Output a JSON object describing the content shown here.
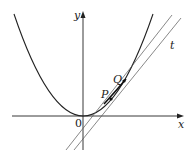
{
  "diagram": {
    "type": "parabola-with-secant-and-tangent",
    "axes": {
      "x_label": "x",
      "y_label": "y",
      "origin_label": "0"
    },
    "curve": {
      "name": "parabola",
      "equation_hint": "y = x^2"
    },
    "points": [
      {
        "label": "P",
        "px": 111,
        "py": 99
      },
      {
        "label": "Q",
        "px": 124,
        "py": 81
      }
    ],
    "lines": [
      {
        "name": "secant-PQ",
        "label": ""
      },
      {
        "name": "tangent",
        "label": "t"
      }
    ],
    "colors": {
      "stroke": "#222222",
      "thin_line": "#555555",
      "background": "#ffffff"
    }
  }
}
